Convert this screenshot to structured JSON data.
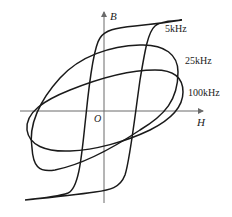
{
  "diagram": {
    "type": "hysteresis-loops",
    "axes": {
      "x_label": "H",
      "y_label": "B",
      "origin_label": "O"
    },
    "curves": [
      {
        "label": "5kHz",
        "shape": "square-ish loop, steep sides, saturating"
      },
      {
        "label": "25kHz",
        "shape": "tilted wide ellipse"
      },
      {
        "label": "100kHz",
        "shape": "flatter tilted ellipse"
      }
    ],
    "colors": {
      "curve": "#1a1a1a",
      "axis": "#6a6a6a",
      "background": "#ffffff"
    }
  }
}
